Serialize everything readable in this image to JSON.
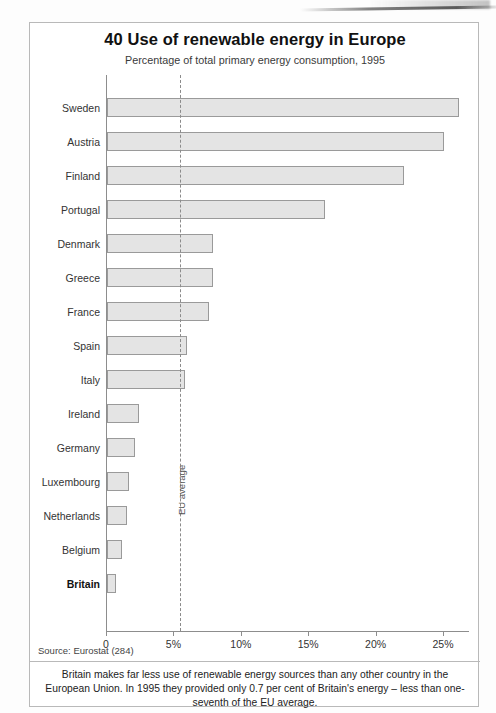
{
  "chart_data": {
    "type": "bar",
    "orientation": "horizontal",
    "title": "40 Use of renewable energy in Europe",
    "subtitle": "Percentage of total primary energy consumption, 1995",
    "xlabel": "",
    "ylabel": "",
    "xlim": [
      0,
      26.9
    ],
    "grid": false,
    "legend": null,
    "categories": [
      "Sweden",
      "Austria",
      "Finland",
      "Portugal",
      "Denmark",
      "Greece",
      "France",
      "Spain",
      "Italy",
      "Ireland",
      "Germany",
      "Luxembourg",
      "Netherlands",
      "Belgium",
      "Britain"
    ],
    "values": [
      26.1,
      25.0,
      22.0,
      16.2,
      7.9,
      7.9,
      7.6,
      5.9,
      5.8,
      2.4,
      2.1,
      1.6,
      1.5,
      1.1,
      0.7
    ],
    "highlight_category": "Britain",
    "tick_values": [
      0,
      5,
      10,
      15,
      20,
      25
    ],
    "tick_labels": [
      "0",
      "5%",
      "10%",
      "15%",
      "20%",
      "25%"
    ],
    "annotations": [
      {
        "name": "eu-average",
        "label": "EU average",
        "value": 5.5,
        "style": "dashed-vertical-line"
      }
    ],
    "source": "Source: Eurostat (284)",
    "note": "Britain makes far less use of renewable energy sources than any other country in the European Union. In 1995 they provided only 0.7 per cent of Britain's energy – less than one-seventh of the EU average."
  },
  "colors": {
    "bar_fill": "#e4e4e4",
    "bar_stroke": "#9a9a9a",
    "axis": "#8d8d8d",
    "frame": "#b9b9b9",
    "text": "#222222"
  }
}
